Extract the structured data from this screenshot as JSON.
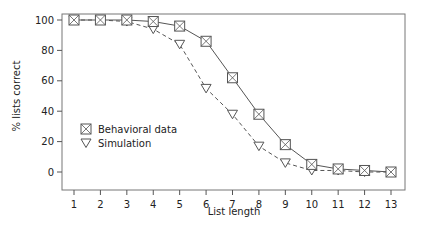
{
  "chart_data": {
    "type": "line",
    "title": "",
    "xlabel": "List length",
    "ylabel": "% lists correct",
    "x": [
      1,
      2,
      3,
      4,
      5,
      6,
      7,
      8,
      9,
      10,
      11,
      12,
      13
    ],
    "xticks": [
      "1",
      "2",
      "3",
      "4",
      "5",
      "6",
      "7",
      "8",
      "9",
      "10",
      "11",
      "12",
      "13"
    ],
    "yticks": [
      "0",
      "20",
      "40",
      "60",
      "80",
      "100"
    ],
    "ylim": [
      0,
      100
    ],
    "xlim": [
      1,
      13
    ],
    "grid": false,
    "legend_position": "lower-left inside",
    "series": [
      {
        "name": "Behavioral data",
        "marker": "boxed-x",
        "line_style": "solid",
        "values": [
          100,
          100,
          100,
          99,
          96,
          86,
          62,
          38,
          18,
          5,
          2,
          1,
          0
        ]
      },
      {
        "name": "Simulation",
        "marker": "down-triangle",
        "line_style": "dashed",
        "values": [
          100,
          100,
          99,
          94,
          84,
          55,
          38,
          17,
          6,
          1,
          1,
          0,
          0
        ]
      }
    ]
  },
  "colors": {
    "axis": "#555555",
    "line": "#555555",
    "text": "#222222"
  }
}
